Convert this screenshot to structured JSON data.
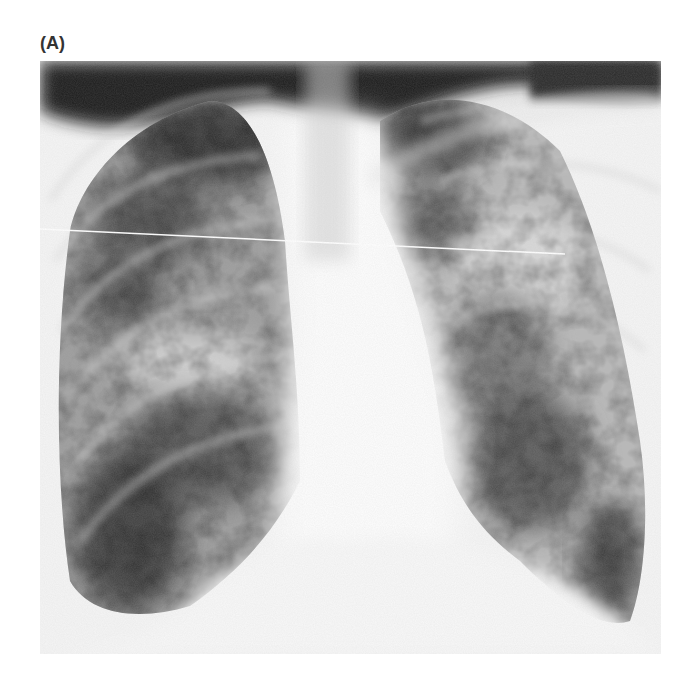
{
  "figure": {
    "panel_label": "(A)",
    "image_kind": "chest radiograph (posteroanterior)",
    "colors": {
      "background": "#ffffff",
      "label": "#333333",
      "dark_air": "#1e1e1e",
      "lung_shadow": "#555555",
      "soft_tissue": "#f6f6f6"
    }
  }
}
